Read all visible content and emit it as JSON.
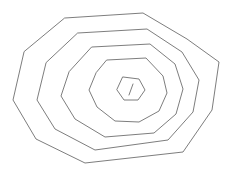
{
  "figure": {
    "background_color": "#ffffff",
    "stroke_color": "#6e6e6e",
    "stroke_width": 0.9,
    "canvas": {
      "width": 228,
      "height": 170
    },
    "ring_count": 5,
    "rings": [
      {
        "name": "outer-ring-1",
        "label": "Ring 1 (outermost)",
        "points": "65,18 143,13 187,39 219,62 212,110 183,152 85,163 36,139 13,100 24,52"
      },
      {
        "name": "ring-2",
        "label": "Ring 2",
        "points": "78,33 147,29 182,52 199,80 193,112 168,140 95,150 55,129 37,100 46,63"
      },
      {
        "name": "ring-3",
        "label": "Ring 3",
        "points": "92,47 150,44 175,64 183,89 176,114 154,133 105,137 75,119 61,96 69,72"
      },
      {
        "name": "ring-4",
        "label": "Ring 4",
        "points": "107,60 146,58 163,76 167,93 159,111 139,122 115,121 97,107 89,90 96,73"
      },
      {
        "name": "ring-5",
        "label": "Ring 5 (innermost pentagon)",
        "points": "123,77 139,79 145,90 138,100 124,100 117,90"
      }
    ],
    "center_tick": {
      "name": "center-tick-mark",
      "label": "Center tick mark",
      "x1": 133,
      "y1": 84,
      "x2": 129,
      "y2": 95
    }
  }
}
